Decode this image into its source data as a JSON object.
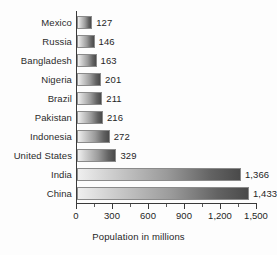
{
  "chart_data": {
    "type": "bar",
    "orientation": "horizontal",
    "title": "",
    "xlabel": "Population in millions",
    "ylabel": "",
    "categories": [
      "Mexico",
      "Russia",
      "Bangladesh",
      "Nigeria",
      "Brazil",
      "Pakistan",
      "Indonesia",
      "United States",
      "India",
      "China"
    ],
    "values": [
      127,
      146,
      163,
      201,
      211,
      216,
      272,
      329,
      1366,
      1433
    ],
    "value_labels": [
      "127",
      "146",
      "163",
      "201",
      "211",
      "216",
      "272",
      "329",
      "1,366",
      "1,433"
    ],
    "xlim": [
      0,
      1500
    ],
    "xticks": [
      0,
      300,
      600,
      900,
      1200,
      1500
    ],
    "xtick_labels": [
      "0",
      "300",
      "600",
      "900",
      "1,200",
      "1,500"
    ],
    "minor_xticks": [
      150,
      450,
      750,
      1050,
      1350
    ],
    "grid": false,
    "legend": null,
    "colors": {
      "bar_gradient_start": "#efefef",
      "bar_gradient_end": "#4a4a4a",
      "bar_border": "#8a8a8a",
      "axis": "#3a3a3a",
      "text": "#1f1f1f",
      "category_text": "#2b2b2b",
      "background": "#fdfdfd"
    }
  }
}
